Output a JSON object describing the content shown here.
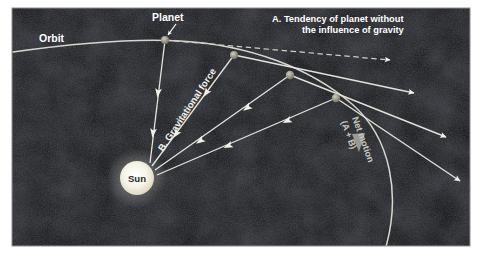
{
  "figure": {
    "background_color": "#0a0a0c",
    "frame_color": "#8e8e8e",
    "page_color": "#ffffff"
  },
  "labels": {
    "orbit": "Orbit",
    "planet": "Planet",
    "sun": "Sun",
    "tendency_line1": "A.  Tendency of planet without",
    "tendency_line2": "the influence of gravity",
    "gravitational_force": "B. Gravitational force",
    "net_motion_line1": "Net motion",
    "net_motion_line2": "(A + B)"
  },
  "colors": {
    "orbit_line": "#d8d8d2",
    "vector_line": "#e8e8e2",
    "dashed_line": "#d0d0c8",
    "sun_fill": "#f4f2e4",
    "sun_glow": "#ffffff",
    "sun_text": "#2a2a2a",
    "planet_dot": "#9a978a",
    "label_text": "#ffffff",
    "net_motion_text": "#c8c8c2",
    "net_arrow": "#9a9a94"
  },
  "geometry": {
    "frame": {
      "x": 12,
      "y": 8,
      "width": 458,
      "height": 238
    },
    "sun": {
      "cx": 137,
      "cy": 178,
      "r": 17
    },
    "planets": [
      {
        "label": "p1",
        "cx": 165,
        "cy": 40,
        "r": 4.0
      },
      {
        "label": "p2",
        "cx": 234,
        "cy": 55,
        "r": 4.0
      },
      {
        "label": "p3",
        "cx": 290,
        "cy": 75,
        "r": 4.2
      },
      {
        "label": "p4",
        "cx": 336,
        "cy": 98,
        "r": 4.2
      }
    ],
    "orbit_path": "M 13 52 C 70 44, 130 38, 180 41 C 250 45, 310 68, 352 104 C 392 139, 400 196, 386 247",
    "tendency_vectors": [
      {
        "from": [
          165,
          40
        ],
        "to": [
          392,
          60
        ]
      },
      {
        "from": [
          234,
          55
        ],
        "to": [
          416,
          94
        ]
      },
      {
        "from": [
          290,
          75
        ],
        "to": [
          448,
          138
        ]
      },
      {
        "from": [
          336,
          98
        ],
        "to": [
          462,
          182
        ]
      }
    ],
    "gravity_vectors": [
      {
        "from": [
          165,
          40
        ],
        "to": [
          150,
          163
        ]
      },
      {
        "from": [
          234,
          55
        ],
        "to": [
          152,
          166
        ]
      },
      {
        "from": [
          290,
          75
        ],
        "to": [
          155,
          170
        ]
      },
      {
        "from": [
          336,
          98
        ],
        "to": [
          156,
          175
        ]
      }
    ],
    "net_arrow_on_orbit": {
      "x": 358,
      "y": 146
    }
  },
  "diagram_content": {
    "type": "vector-diagram",
    "description": "Four successive positions of a planet along a curved orbit around the Sun. At each position a dashed straight arrow (A) shows the inertial tendency to continue in a straight line, and a solid arrow (B) points toward the Sun showing gravitational force. Their sum produces the curved net motion along the orbit.",
    "elements": [
      "Orbit curve passing across the upper-left and down to lower-right",
      "Sun at lower-left with radiating gravitational force arrows",
      "Four planet positions along the orbit",
      "Dashed tangent vectors labeled A",
      "Solid Sun-directed vectors labeled B",
      "Net motion label along the orbit arc"
    ]
  }
}
